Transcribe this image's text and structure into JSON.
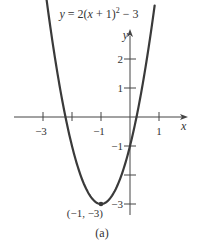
{
  "chart_data": {
    "type": "line",
    "title_parts": {
      "pre": "y",
      "mid": " = 2(",
      "x": "x",
      "post1": " + 1)",
      "exp": "2",
      "post2": " − 3"
    },
    "xlabel": "x",
    "ylabel": "y",
    "caption": "(a)",
    "function": "2*(x+1)^2 - 3",
    "xlim": [
      -3.7,
      1.9
    ],
    "ylim": [
      -3.4,
      3.1
    ],
    "x_ticks": [
      -3,
      -2,
      -1,
      1
    ],
    "x_tick_labels": [
      {
        "value": -3,
        "label": "−3"
      },
      {
        "value": -1,
        "label": "−1"
      },
      {
        "value": 1,
        "label": "1"
      }
    ],
    "y_ticks": [
      2,
      1,
      -1,
      -2,
      -3
    ],
    "y_tick_labels": [
      {
        "value": 2,
        "label": "2"
      },
      {
        "value": 1,
        "label": "1"
      },
      {
        "value": -1,
        "label": "−1"
      },
      {
        "value": -3,
        "label": "−3"
      }
    ],
    "vertex": {
      "x": -1,
      "y": -3,
      "label": "(−1, −3)"
    },
    "grid": false,
    "line_color": "#3a3a3a",
    "axis_color": "#444444",
    "x_domain": [
      -2.9,
      0.85
    ]
  }
}
